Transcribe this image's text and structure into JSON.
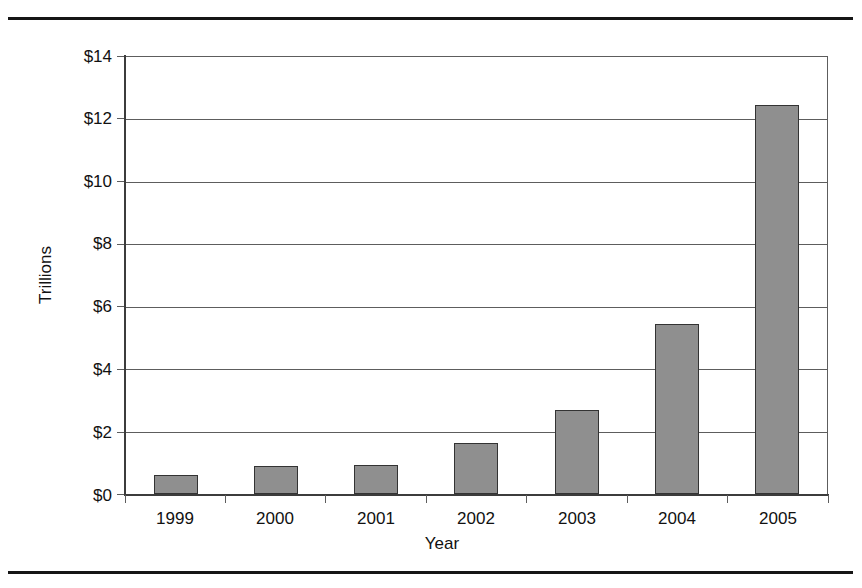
{
  "chart_data": {
    "type": "bar",
    "title": "",
    "subtitle": "",
    "xlabel": "Year",
    "ylabel": "Trillions",
    "categories": [
      "1999",
      "2000",
      "2001",
      "2002",
      "2003",
      "2004",
      "2005"
    ],
    "values": [
      0.6,
      0.9,
      0.92,
      1.65,
      2.7,
      5.45,
      12.45
    ],
    "series": [
      {
        "name": "",
        "values": [
          0.6,
          0.9,
          0.92,
          1.65,
          2.7,
          5.45,
          12.45
        ]
      }
    ],
    "ylim": [
      0,
      14
    ],
    "ytick_values": [
      0,
      2,
      4,
      6,
      8,
      10,
      12,
      14
    ],
    "ytick_labels": [
      "$0",
      "$2",
      "$4",
      "$6",
      "$8",
      "$10",
      "$12",
      "$14"
    ],
    "xtick_labels": [
      "1999",
      "2000",
      "2001",
      "2002",
      "2003",
      "2004",
      "2005"
    ],
    "grid": true,
    "grid_axis": "y",
    "legend": false,
    "legend_position": "none",
    "bar_fill_color": "#8f8f8f",
    "bar_edge_color": "#333333",
    "axis_color": "#3c3c3c",
    "grid_color": "#5d5d5d",
    "background_color": "#ffffff"
  },
  "axis_labels": {
    "y_title": "Trillions",
    "x_title": "Year"
  },
  "y_ticks": [
    {
      "label": "$14",
      "value": 14
    },
    {
      "label": "$12",
      "value": 12
    },
    {
      "label": "$10",
      "value": 10
    },
    {
      "label": "$8",
      "value": 8
    },
    {
      "label": "$6",
      "value": 6
    },
    {
      "label": "$4",
      "value": 4
    },
    {
      "label": "$2",
      "value": 2
    },
    {
      "label": "$0",
      "value": 0
    }
  ],
  "x_ticks": [
    {
      "label": "1999"
    },
    {
      "label": "2000"
    },
    {
      "label": "2001"
    },
    {
      "label": "2002"
    },
    {
      "label": "2003"
    },
    {
      "label": "2004"
    },
    {
      "label": "2005"
    }
  ]
}
